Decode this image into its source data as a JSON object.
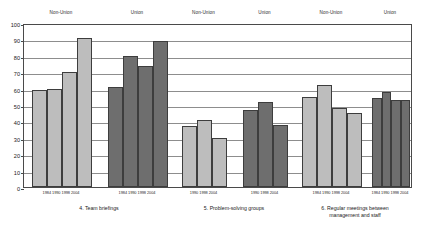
{
  "chart_data": {
    "type": "bar",
    "title": "",
    "subtitle": "",
    "xlabel": "",
    "ylabel": "",
    "ylim": [
      0,
      100
    ],
    "ytick_step": 10,
    "yticks": [
      "100",
      "90",
      "80",
      "70",
      "60",
      "50",
      "40",
      "30",
      "20",
      "10",
      "0"
    ],
    "grid": true,
    "legend_position": "none",
    "group_headers": [
      "Non-Union",
      "Union",
      "Non-Union",
      "Union",
      "Non-Union",
      "Union"
    ],
    "categories": [
      "4. Team briefings",
      "5. Problem-solving groups",
      "6. Regular meetings between\nmanagement and staff"
    ],
    "groups": [
      {
        "category": "4. Team briefings",
        "union_status": "Non-Union",
        "fill": "light",
        "x": [
          "1984",
          "1990",
          "1998",
          "2004"
        ],
        "values": [
          59,
          60,
          70,
          91
        ]
      },
      {
        "category": "4. Team briefings",
        "union_status": "Union",
        "fill": "dark",
        "x": [
          "1984",
          "1990",
          "1998",
          "2004"
        ],
        "values": [
          61,
          80,
          74,
          89
        ]
      },
      {
        "category": "5. Problem-solving groups",
        "union_status": "Non-Union",
        "fill": "light",
        "x": [
          "1990",
          "1998",
          "2004"
        ],
        "values": [
          37,
          41,
          30
        ]
      },
      {
        "category": "5. Problem-solving groups",
        "union_status": "Union",
        "fill": "dark",
        "x": [
          "1990",
          "1998",
          "2004"
        ],
        "values": [
          47,
          52,
          38
        ]
      },
      {
        "category": "6. Regular meetings between\nmanagement and staff",
        "union_status": "Non-Union",
        "fill": "light",
        "x": [
          "1984",
          "1990",
          "1998",
          "2004"
        ],
        "values": [
          55,
          62,
          48,
          45
        ]
      },
      {
        "category": "6. Regular meetings between\nmanagement and staff",
        "union_status": "Union",
        "fill": "dark",
        "x": [
          "1984",
          "1990",
          "1998",
          "2004"
        ],
        "values": [
          54,
          58,
          53,
          53
        ]
      }
    ],
    "colors": {
      "light_bar": "#bdbdbd",
      "dark_bar": "#6e6e6e",
      "bar_border": "#3d3d3d",
      "gridline": "#8d8d8d",
      "axis": "#4a4a4a",
      "background": "#ffffff",
      "text": "#1a1a1a"
    }
  }
}
